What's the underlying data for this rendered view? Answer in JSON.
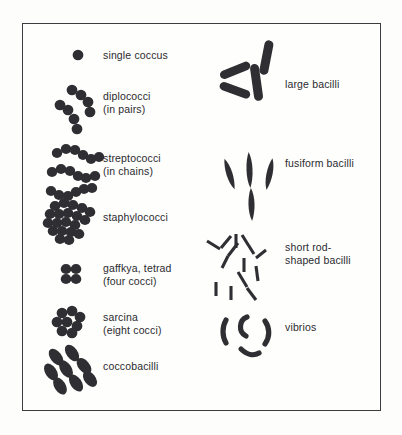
{
  "figure": {
    "frame": {
      "border_color": "#3b3b40",
      "background": "#fefefd"
    },
    "ink_color": "#2f2f33",
    "text_color": "#2a2a2e"
  },
  "left_column": {
    "items": [
      {
        "id": "single-coccus",
        "label": "single coccus",
        "label_x": 103,
        "label_y": 49,
        "shape": "single-sphere",
        "count": 1
      },
      {
        "id": "diplococci",
        "label": "diplococci\n(in pairs)",
        "label_x": 103,
        "label_y": 90,
        "shape": "sphere-pairs",
        "count": 8
      },
      {
        "id": "streptococci",
        "label": "streptococci\n(in chains)",
        "label_x": 103,
        "label_y": 152,
        "shape": "sphere-chains",
        "count": 20
      },
      {
        "id": "staphylococci",
        "label": "staphylococci",
        "label_x": 103,
        "label_y": 211,
        "shape": "sphere-cluster",
        "count": 28
      },
      {
        "id": "gaffkya-tetrad",
        "label": "gaffkya, tetrad\n(four cocci)",
        "label_x": 103,
        "label_y": 262,
        "shape": "sphere-tetrad",
        "count": 4
      },
      {
        "id": "sarcina",
        "label": "sarcina\n(eight cocci)",
        "label_x": 103,
        "label_y": 311,
        "shape": "sphere-packet",
        "count": 8
      },
      {
        "id": "coccobacilli",
        "label": "coccobacilli",
        "label_x": 103,
        "label_y": 360,
        "shape": "short-ovals",
        "count": 8
      }
    ]
  },
  "right_column": {
    "items": [
      {
        "id": "large-bacilli",
        "label": "large bacilli",
        "label_x": 285,
        "label_y": 78,
        "shape": "thick-rods",
        "count": 4
      },
      {
        "id": "fusiform-bacilli",
        "label": "fusiform bacilli",
        "label_x": 285,
        "label_y": 157,
        "shape": "spindles",
        "count": 4
      },
      {
        "id": "short-rod-shaped-bacilli",
        "label": "short rod-\nshaped bacilli",
        "label_x": 285,
        "label_y": 241,
        "shape": "thin-rods",
        "count": 13
      },
      {
        "id": "vibrios",
        "label": "vibrios",
        "label_x": 285,
        "label_y": 321,
        "shape": "curved-commas",
        "count": 4
      }
    ]
  }
}
